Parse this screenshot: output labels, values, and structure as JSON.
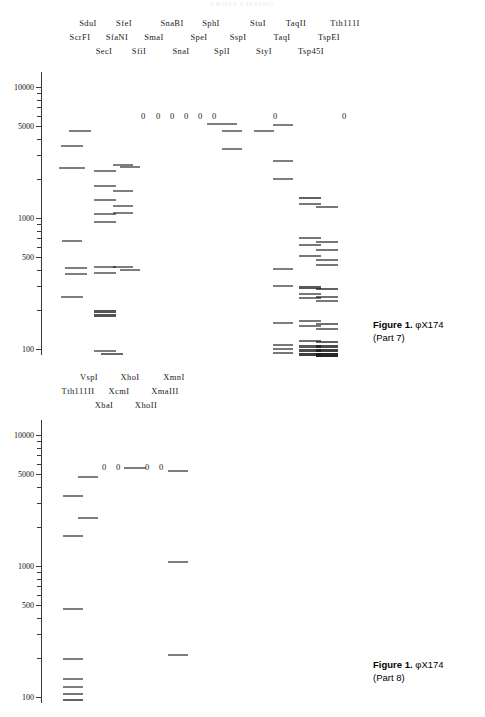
{
  "top_partial_text": "CROSS LISTING",
  "panels": [
    {
      "id": "part7",
      "caption_title": "Figure 1.",
      "caption_organism": "φX174",
      "caption_part": "(Part 7)",
      "axis": {
        "scale": "log",
        "unit": "bp",
        "labels": [
          "10000",
          "5000",
          "1000",
          "500",
          "100"
        ],
        "values": [
          10000,
          5000,
          1000,
          500,
          100
        ],
        "range": [
          90,
          13000
        ]
      },
      "lanes": [
        {
          "name": "ScrFI",
          "row": 1,
          "x": 80,
          "no_cut": false
        },
        {
          "name": "SduI",
          "row": 0,
          "x": 88,
          "no_cut": false
        },
        {
          "name": "SecI",
          "row": 2,
          "x": 104,
          "no_cut": false
        },
        {
          "name": "SfaNI",
          "row": 1,
          "x": 117,
          "no_cut": false
        },
        {
          "name": "SfeI",
          "row": 0,
          "x": 124,
          "no_cut": false
        },
        {
          "name": "SfiI",
          "row": 2,
          "x": 139,
          "no_cut": true
        },
        {
          "name": "SmaI",
          "row": 1,
          "x": 154,
          "no_cut": true
        },
        {
          "name": "SnaBI",
          "row": 0,
          "x": 172,
          "no_cut": true
        },
        {
          "name": "SnaI",
          "row": 2,
          "x": 181,
          "no_cut": true
        },
        {
          "name": "SpeI",
          "row": 1,
          "x": 199,
          "no_cut": true
        },
        {
          "name": "SphI",
          "row": 0,
          "x": 211,
          "no_cut": true
        },
        {
          "name": "SplI",
          "row": 2,
          "x": 222,
          "no_cut": false
        },
        {
          "name": "SspI",
          "row": 1,
          "x": 238,
          "no_cut": false
        },
        {
          "name": "StuI",
          "row": 0,
          "x": 258,
          "no_cut": true
        },
        {
          "name": "StyI",
          "row": 2,
          "x": 264,
          "no_cut": false
        },
        {
          "name": "TaqI",
          "row": 1,
          "x": 282,
          "no_cut": false
        },
        {
          "name": "TaqII",
          "row": 0,
          "x": 296,
          "no_cut": false
        },
        {
          "name": "Tsp45I",
          "row": 2,
          "x": 311,
          "no_cut": false
        },
        {
          "name": "TspEI",
          "row": 1,
          "x": 329,
          "no_cut": false
        },
        {
          "name": "Tth111I",
          "row": 0,
          "x": 345,
          "no_cut": true
        }
      ],
      "zero_markers": [
        {
          "x": 143,
          "y": 116
        },
        {
          "x": 158,
          "y": 116
        },
        {
          "x": 172,
          "y": 116
        },
        {
          "x": 186,
          "y": 116
        },
        {
          "x": 200,
          "y": 116
        },
        {
          "x": 214,
          "y": 116
        },
        {
          "x": 275,
          "y": 116
        },
        {
          "x": 344,
          "y": 116
        }
      ],
      "bands": [
        {
          "lane": "ScrFI",
          "x": 80,
          "y": 130,
          "w": 22,
          "h": 1.6,
          "bp": 4400
        },
        {
          "lane": "ScrFI",
          "x": 72,
          "y": 145,
          "w": 22,
          "h": 1.6,
          "bp": 3300
        },
        {
          "lane": "ScrFI",
          "x": 72,
          "y": 167,
          "w": 26,
          "h": 1.6,
          "bp": 2200
        },
        {
          "lane": "ScrFI",
          "x": 72,
          "y": 240,
          "w": 20,
          "h": 1.6,
          "bp": 740
        },
        {
          "lane": "ScrFI",
          "x": 76,
          "y": 267,
          "w": 22,
          "h": 1.6,
          "bp": 510
        },
        {
          "lane": "ScrFI",
          "x": 76,
          "y": 273,
          "w": 22,
          "h": 1.6,
          "bp": 490
        },
        {
          "lane": "ScrFI",
          "x": 72,
          "y": 296,
          "w": 22,
          "h": 1.6,
          "bp": 360
        },
        {
          "lane": "SduI",
          "x": 105,
          "y": 170,
          "w": 22,
          "h": 1.6,
          "bp": 2100
        },
        {
          "lane": "SduI",
          "x": 105,
          "y": 185,
          "w": 22,
          "h": 1.6,
          "bp": 1600
        },
        {
          "lane": "SduI",
          "x": 105,
          "y": 199,
          "w": 22,
          "h": 1.6,
          "bp": 1200
        },
        {
          "lane": "SduI",
          "x": 105,
          "y": 213,
          "w": 22,
          "h": 1.6,
          "bp": 950
        },
        {
          "lane": "SduI",
          "x": 105,
          "y": 221,
          "w": 22,
          "h": 1.6,
          "bp": 820
        },
        {
          "lane": "SduI",
          "x": 105,
          "y": 266,
          "w": 22,
          "h": 1.6,
          "bp": 520
        },
        {
          "lane": "SduI",
          "x": 105,
          "y": 272,
          "w": 22,
          "h": 1.6,
          "bp": 480
        },
        {
          "lane": "SduI",
          "x": 105,
          "y": 310,
          "w": 22,
          "h": 2.8,
          "bp": 300
        },
        {
          "lane": "SduI",
          "x": 105,
          "y": 314,
          "w": 22,
          "h": 2.8,
          "bp": 285
        },
        {
          "lane": "SduI",
          "x": 105,
          "y": 350,
          "w": 22,
          "h": 1.6,
          "bp": 120
        },
        {
          "lane": "SduI",
          "x": 112,
          "y": 353,
          "w": 22,
          "h": 2.2,
          "bp": 108
        },
        {
          "lane": "SecI",
          "x": 123,
          "y": 164,
          "w": 20,
          "h": 1.6,
          "bp": 2400
        },
        {
          "lane": "SecI",
          "x": 123,
          "y": 190,
          "w": 20,
          "h": 1.6,
          "bp": 1450
        },
        {
          "lane": "SecI",
          "x": 123,
          "y": 205,
          "w": 20,
          "h": 1.6,
          "bp": 1100
        },
        {
          "lane": "SecI",
          "x": 123,
          "y": 212,
          "w": 20,
          "h": 1.6,
          "bp": 980
        },
        {
          "lane": "SecI",
          "x": 123,
          "y": 266,
          "w": 20,
          "h": 1.6,
          "bp": 520
        },
        {
          "lane": "SfaNI",
          "x": 130,
          "y": 166,
          "w": 20,
          "h": 1.6,
          "bp": 2250
        },
        {
          "lane": "SfaNI",
          "x": 130,
          "y": 269,
          "w": 20,
          "h": 1.6,
          "bp": 500
        },
        {
          "lane": "SspI",
          "x": 232,
          "y": 130,
          "w": 20,
          "h": 1.6,
          "bp": 4400
        },
        {
          "lane": "SspI",
          "x": 232,
          "y": 148,
          "w": 20,
          "h": 1.6,
          "bp": 3100
        },
        {
          "lane": "SplI",
          "x": 222,
          "y": 123,
          "w": 30,
          "h": 1.6,
          "bp": 5100
        },
        {
          "lane": "StyI",
          "x": 264,
          "y": 130,
          "w": 20,
          "h": 1.6,
          "bp": 4400
        },
        {
          "lane": "TaqI",
          "x": 283,
          "y": 124,
          "w": 20,
          "h": 1.6,
          "bp": 5000
        },
        {
          "lane": "TaqI",
          "x": 283,
          "y": 160,
          "w": 20,
          "h": 1.6,
          "bp": 2700
        },
        {
          "lane": "TaqI",
          "x": 283,
          "y": 178,
          "w": 20,
          "h": 1.6,
          "bp": 1900
        },
        {
          "lane": "TaqI",
          "x": 283,
          "y": 268,
          "w": 20,
          "h": 1.6,
          "bp": 510
        },
        {
          "lane": "TaqI",
          "x": 283,
          "y": 285,
          "w": 20,
          "h": 1.6,
          "bp": 420
        },
        {
          "lane": "TaqI",
          "x": 283,
          "y": 322,
          "w": 20,
          "h": 1.6,
          "bp": 245
        },
        {
          "lane": "TaqI",
          "x": 283,
          "y": 344,
          "w": 20,
          "h": 1.8,
          "bp": 140
        },
        {
          "lane": "TaqI",
          "x": 283,
          "y": 348,
          "w": 20,
          "h": 1.8,
          "bp": 128
        },
        {
          "lane": "TaqI",
          "x": 283,
          "y": 352,
          "w": 20,
          "h": 1.8,
          "bp": 116
        },
        {
          "lane": "TspEI",
          "x": 310,
          "y": 197,
          "w": 22,
          "h": 2.4,
          "bp": 1250
        },
        {
          "lane": "TspEI",
          "x": 310,
          "y": 203,
          "w": 22,
          "h": 1.8,
          "bp": 1120
        },
        {
          "lane": "TspEI",
          "x": 310,
          "y": 237,
          "w": 22,
          "h": 1.8,
          "bp": 760
        },
        {
          "lane": "TspEI",
          "x": 310,
          "y": 244,
          "w": 22,
          "h": 1.8,
          "bp": 690
        },
        {
          "lane": "TspEI",
          "x": 310,
          "y": 255,
          "w": 22,
          "h": 1.8,
          "bp": 590
        },
        {
          "lane": "TspEI",
          "x": 310,
          "y": 286,
          "w": 22,
          "h": 2.6,
          "bp": 410
        },
        {
          "lane": "TspEI",
          "x": 310,
          "y": 293,
          "w": 22,
          "h": 1.8,
          "bp": 375
        },
        {
          "lane": "TspEI",
          "x": 310,
          "y": 297,
          "w": 22,
          "h": 1.8,
          "bp": 358
        },
        {
          "lane": "TspEI",
          "x": 310,
          "y": 320,
          "w": 22,
          "h": 1.8,
          "bp": 250
        },
        {
          "lane": "TspEI",
          "x": 310,
          "y": 325,
          "w": 22,
          "h": 1.8,
          "bp": 232
        },
        {
          "lane": "TspEI",
          "x": 310,
          "y": 340,
          "w": 22,
          "h": 2.0,
          "bp": 160
        },
        {
          "lane": "TspEI",
          "x": 310,
          "y": 345,
          "w": 22,
          "h": 2.6,
          "bp": 138
        },
        {
          "lane": "TspEI",
          "x": 310,
          "y": 349,
          "w": 22,
          "h": 3.0,
          "bp": 122
        },
        {
          "lane": "TspEI",
          "x": 310,
          "y": 353,
          "w": 22,
          "h": 3.4,
          "bp": 108
        },
        {
          "lane": "Tsp45I",
          "x": 327,
          "y": 206,
          "w": 22,
          "h": 1.8,
          "bp": 1080
        },
        {
          "lane": "Tsp45I",
          "x": 327,
          "y": 241,
          "w": 22,
          "h": 1.8,
          "bp": 720
        },
        {
          "lane": "Tsp45I",
          "x": 327,
          "y": 249,
          "w": 22,
          "h": 1.8,
          "bp": 640
        },
        {
          "lane": "Tsp45I",
          "x": 327,
          "y": 259,
          "w": 22,
          "h": 1.8,
          "bp": 555
        },
        {
          "lane": "Tsp45I",
          "x": 327,
          "y": 264,
          "w": 22,
          "h": 1.8,
          "bp": 525
        },
        {
          "lane": "Tsp45I",
          "x": 327,
          "y": 288,
          "w": 22,
          "h": 2.4,
          "bp": 400
        },
        {
          "lane": "Tsp45I",
          "x": 327,
          "y": 296,
          "w": 22,
          "h": 2.0,
          "bp": 362
        },
        {
          "lane": "Tsp45I",
          "x": 327,
          "y": 300,
          "w": 22,
          "h": 1.8,
          "bp": 345
        },
        {
          "lane": "Tsp45I",
          "x": 327,
          "y": 323,
          "w": 22,
          "h": 2.0,
          "bp": 240
        },
        {
          "lane": "Tsp45I",
          "x": 327,
          "y": 328,
          "w": 22,
          "h": 1.8,
          "bp": 222
        },
        {
          "lane": "Tsp45I",
          "x": 327,
          "y": 341,
          "w": 22,
          "h": 2.4,
          "bp": 152
        },
        {
          "lane": "Tsp45I",
          "x": 327,
          "y": 345,
          "w": 22,
          "h": 3.0,
          "bp": 136
        },
        {
          "lane": "Tsp45I",
          "x": 327,
          "y": 349,
          "w": 22,
          "h": 3.4,
          "bp": 120
        },
        {
          "lane": "Tsp45I",
          "x": 327,
          "y": 353,
          "w": 22,
          "h": 4.0,
          "bp": 105
        }
      ]
    },
    {
      "id": "part8",
      "caption_title": "Figure 1.",
      "caption_organism": "φX174",
      "caption_part": "(Part 8)",
      "axis": {
        "scale": "log",
        "unit": "bp",
        "labels": [
          "10000",
          "5000",
          "1000",
          "500",
          "100"
        ],
        "values": [
          10000,
          5000,
          1000,
          500,
          100
        ],
        "range": [
          90,
          13000
        ]
      },
      "lanes": [
        {
          "name": "Tth111II",
          "row": 1,
          "x": 78,
          "no_cut": false
        },
        {
          "name": "VspI",
          "row": 0,
          "x": 89,
          "no_cut": false
        },
        {
          "name": "XbaI",
          "row": 2,
          "x": 104,
          "no_cut": true
        },
        {
          "name": "XcmI",
          "row": 1,
          "x": 119,
          "no_cut": true
        },
        {
          "name": "XhoI",
          "row": 0,
          "x": 130,
          "no_cut": true
        },
        {
          "name": "XhoII",
          "row": 2,
          "x": 146,
          "no_cut": false
        },
        {
          "name": "XmaIII",
          "row": 1,
          "x": 165,
          "no_cut": true
        },
        {
          "name": "XmnI",
          "row": 0,
          "x": 174,
          "no_cut": true
        }
      ],
      "zero_markers": [
        {
          "x": 104,
          "y": 467
        },
        {
          "x": 118,
          "y": 467
        },
        {
          "x": 147,
          "y": 467
        },
        {
          "x": 161,
          "y": 467
        }
      ],
      "bands": [
        {
          "lane": "Tth111II",
          "x": 88,
          "y": 476,
          "w": 20,
          "h": 1.6,
          "bp": 5100
        },
        {
          "lane": "Tth111II",
          "x": 73,
          "y": 495,
          "w": 20,
          "h": 1.6,
          "bp": 3300
        },
        {
          "lane": "Tth111II",
          "x": 88,
          "y": 517,
          "w": 20,
          "h": 1.6,
          "bp": 2200
        },
        {
          "lane": "Tth111II",
          "x": 73,
          "y": 535,
          "w": 20,
          "h": 1.6,
          "bp": 1650
        },
        {
          "lane": "Tth111II",
          "x": 73,
          "y": 608,
          "w": 20,
          "h": 1.6,
          "bp": 520
        },
        {
          "lane": "Tth111II",
          "x": 73,
          "y": 658,
          "w": 20,
          "h": 1.6,
          "bp": 225
        },
        {
          "lane": "Tth111II",
          "x": 73,
          "y": 678,
          "w": 20,
          "h": 1.6,
          "bp": 148
        },
        {
          "lane": "Tth111II",
          "x": 73,
          "y": 686,
          "w": 20,
          "h": 1.6,
          "bp": 128
        },
        {
          "lane": "Tth111II",
          "x": 73,
          "y": 693,
          "w": 20,
          "h": 1.8,
          "bp": 112
        },
        {
          "lane": "Tth111II",
          "x": 73,
          "y": 699,
          "w": 20,
          "h": 2.4,
          "bp": 100
        },
        {
          "lane": "XhoII",
          "x": 135,
          "y": 467,
          "w": 22,
          "h": 1.6,
          "bp": 5300
        },
        {
          "lane": "XhoII",
          "x": 178,
          "y": 470,
          "w": 20,
          "h": 1.6,
          "bp": 5000
        },
        {
          "lane": "XhoII",
          "x": 178,
          "y": 561,
          "w": 20,
          "h": 1.6,
          "bp": 960
        },
        {
          "lane": "XhoII",
          "x": 178,
          "y": 654,
          "w": 20,
          "h": 1.6,
          "bp": 238
        }
      ]
    }
  ]
}
